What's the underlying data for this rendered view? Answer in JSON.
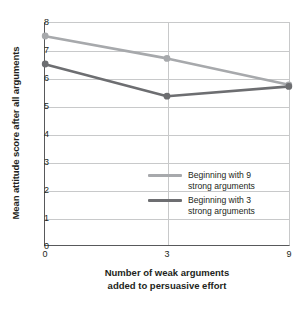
{
  "chart_data": {
    "type": "line",
    "title": "",
    "xlabel": "Number of weak arguments\nadded to persuasive effort",
    "xlabel_line1": "Number of weak arguments",
    "xlabel_line2": "added to persuasive effort",
    "ylabel": "Mean attitude score after all arguments",
    "x": [
      0,
      3,
      9
    ],
    "xticklabels": [
      "0",
      "3",
      "9"
    ],
    "yticklabels": [
      "0",
      "1",
      "2",
      "3",
      "4",
      "5",
      "6",
      "7",
      "8"
    ],
    "ylim": [
      0,
      8
    ],
    "grid": "horizontal-and-vertical",
    "legend_position": "inside-center-right",
    "series": [
      {
        "name": "Beginning with 9 strong arguments",
        "name_line1": "Beginning with 9",
        "name_line2": "strong arguments",
        "color": "#a7a9ac",
        "values": [
          7.5,
          6.7,
          5.75
        ]
      },
      {
        "name": "Beginning with 3 strong arguments",
        "name_line1": "Beginning with 3",
        "name_line2": "strong arguments",
        "color": "#6d6e71",
        "values": [
          6.5,
          5.35,
          5.7
        ]
      }
    ]
  },
  "colors": {
    "axis": "#58595b",
    "grid": "#c8c9ca",
    "text": "#231f20",
    "background": "#ffffff"
  }
}
